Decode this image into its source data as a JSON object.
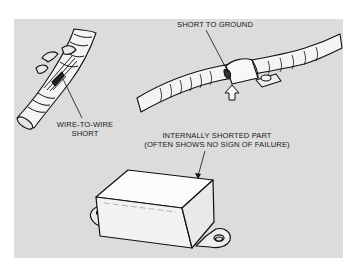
{
  "diagram": {
    "background_color": "#ffffff",
    "panel_color": "#dcdcdc",
    "callouts": [
      {
        "id": "wire-to-wire",
        "lines": [
          "WIRE-TO-WIRE",
          "SHORT"
        ]
      },
      {
        "id": "short-to-ground",
        "lines": [
          "SHORT TO GROUND"
        ]
      },
      {
        "id": "internal-part",
        "lines": [
          "INTERNALLY SHORTED PART",
          "(OFTEN SHOWS NO SIGN OF FAILURE)"
        ]
      }
    ]
  }
}
